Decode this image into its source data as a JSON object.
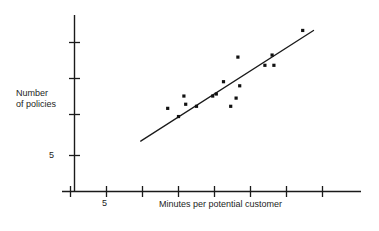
{
  "chart_data": {
    "type": "scatter",
    "title": "",
    "xlabel": "Minutes per potential customer",
    "ylabel": "Number of policies",
    "ylabel_line1": "Number",
    "ylabel_line2": "of policies",
    "grid": false,
    "legend": null,
    "xlim": [
      2,
      18
    ],
    "ylim": [
      3,
      13
    ],
    "x_ticks": [
      3,
      5,
      7,
      9,
      11,
      13,
      15,
      17
    ],
    "x_tick_labels": [
      "",
      "5",
      "",
      "",
      "",
      "",
      "",
      ""
    ],
    "y_ticks": [
      5,
      7,
      9,
      11
    ],
    "y_tick_labels": [
      "5",
      "",
      "",
      ""
    ],
    "points": [
      {
        "x": 8.4,
        "y": 7.3
      },
      {
        "x": 9.0,
        "y": 6.9
      },
      {
        "x": 9.3,
        "y": 7.9
      },
      {
        "x": 9.4,
        "y": 7.5
      },
      {
        "x": 10.0,
        "y": 7.4
      },
      {
        "x": 10.9,
        "y": 7.9
      },
      {
        "x": 11.1,
        "y": 8.0
      },
      {
        "x": 11.5,
        "y": 8.6
      },
      {
        "x": 11.9,
        "y": 7.4
      },
      {
        "x": 12.2,
        "y": 7.8
      },
      {
        "x": 12.4,
        "y": 8.4
      },
      {
        "x": 12.3,
        "y": 9.8
      },
      {
        "x": 13.8,
        "y": 9.4
      },
      {
        "x": 14.2,
        "y": 9.9
      },
      {
        "x": 14.3,
        "y": 9.4
      },
      {
        "x": 15.9,
        "y": 11.1
      }
    ],
    "fit_line": {
      "type": "linear-trend",
      "x_start": 6.9,
      "y_start": 5.7,
      "x_end": 16.5,
      "y_end": 11.1
    },
    "point_count": 16
  },
  "figure": {
    "background_color": "#ffffff",
    "axis_color": "#1a1a1a",
    "point_color": "#111111",
    "line_color": "#1a1a1a"
  }
}
